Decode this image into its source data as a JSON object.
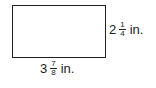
{
  "diagram": {
    "shape": "rectangle",
    "height_label": {
      "whole": "2",
      "numerator": "1",
      "denominator": "4",
      "unit": "in."
    },
    "width_label": {
      "whole": "3",
      "numerator": "7",
      "denominator": "8",
      "unit": "in."
    }
  }
}
